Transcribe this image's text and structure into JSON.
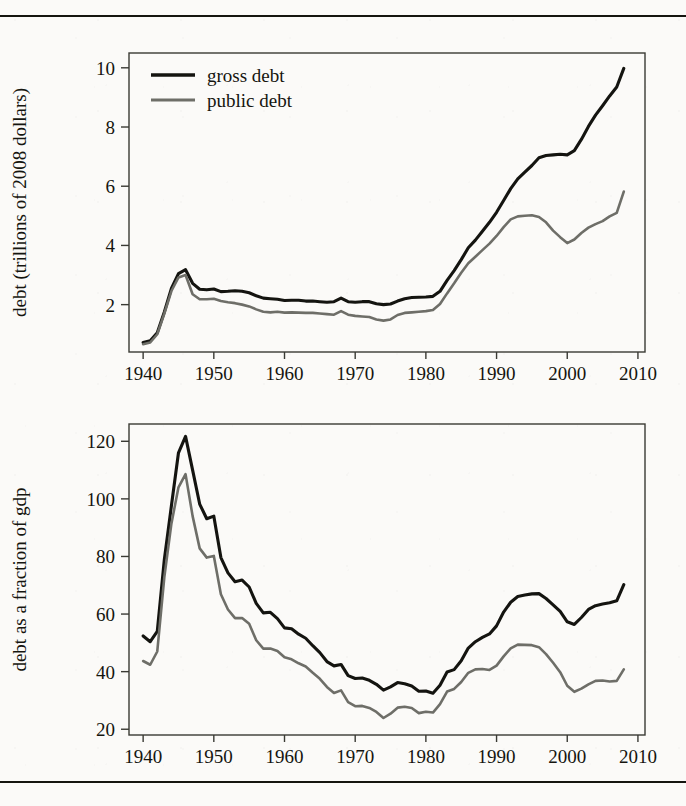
{
  "figure": {
    "kind": "two-panel-line-figure",
    "series_colors": {
      "gross_debt": "#141410",
      "public_debt": "#6e6e68"
    },
    "legend": {
      "position": "top-left-inside-panel-1",
      "entries": [
        {
          "label": "gross debt",
          "color": "#141410"
        },
        {
          "label": "public debt",
          "color": "#6e6e68"
        }
      ]
    }
  },
  "chart_data": [
    {
      "type": "line",
      "panel": "top",
      "title": "",
      "xlabel": "",
      "ylabel": "debt (trillions of 2008 dollars)",
      "xlim": [
        1938,
        2011
      ],
      "ylim": [
        0.4,
        10.5
      ],
      "grid": false,
      "xticks": [
        1940,
        1950,
        1960,
        1970,
        1980,
        1990,
        2000,
        2010
      ],
      "yticks": [
        2,
        4,
        6,
        8,
        10
      ],
      "xticklabels": [
        "1940",
        "1950",
        "1960",
        "1970",
        "1980",
        "1990",
        "2000",
        "2010"
      ],
      "yticklabels": [
        "2",
        "4",
        "6",
        "8",
        "10"
      ],
      "legend_position": "upper left",
      "x": [
        1940,
        1941,
        1942,
        1943,
        1944,
        1945,
        1946,
        1947,
        1948,
        1949,
        1950,
        1951,
        1952,
        1953,
        1954,
        1955,
        1956,
        1957,
        1958,
        1959,
        1960,
        1961,
        1962,
        1963,
        1964,
        1965,
        1966,
        1967,
        1968,
        1969,
        1970,
        1971,
        1972,
        1973,
        1974,
        1975,
        1976,
        1977,
        1978,
        1979,
        1980,
        1981,
        1982,
        1983,
        1984,
        1985,
        1986,
        1987,
        1988,
        1989,
        1990,
        1991,
        1992,
        1993,
        1994,
        1995,
        1996,
        1997,
        1998,
        1999,
        2000,
        2001,
        2002,
        2003,
        2004,
        2005,
        2006,
        2007,
        2008
      ],
      "series": [
        {
          "name": "gross debt",
          "color": "#141410",
          "values": [
            0.72,
            0.78,
            1.05,
            1.75,
            2.55,
            3.05,
            3.18,
            2.72,
            2.52,
            2.5,
            2.53,
            2.44,
            2.45,
            2.47,
            2.45,
            2.4,
            2.3,
            2.22,
            2.2,
            2.18,
            2.14,
            2.15,
            2.15,
            2.12,
            2.12,
            2.1,
            2.08,
            2.1,
            2.22,
            2.1,
            2.08,
            2.1,
            2.1,
            2.03,
            2.0,
            2.02,
            2.12,
            2.2,
            2.24,
            2.25,
            2.26,
            2.28,
            2.45,
            2.82,
            3.15,
            3.52,
            3.92,
            4.18,
            4.48,
            4.78,
            5.12,
            5.52,
            5.92,
            6.25,
            6.48,
            6.7,
            6.96,
            7.04,
            7.06,
            7.08,
            7.06,
            7.2,
            7.58,
            8.02,
            8.4,
            8.72,
            9.05,
            9.35,
            9.98
          ]
        },
        {
          "name": "public debt",
          "color": "#6e6e68",
          "values": [
            0.66,
            0.72,
            1.0,
            1.7,
            2.46,
            2.92,
            3.0,
            2.35,
            2.18,
            2.18,
            2.2,
            2.12,
            2.08,
            2.05,
            2.0,
            1.94,
            1.84,
            1.76,
            1.74,
            1.76,
            1.73,
            1.74,
            1.73,
            1.72,
            1.72,
            1.7,
            1.68,
            1.66,
            1.78,
            1.66,
            1.62,
            1.6,
            1.58,
            1.5,
            1.46,
            1.5,
            1.65,
            1.72,
            1.74,
            1.76,
            1.78,
            1.82,
            2.02,
            2.38,
            2.72,
            3.08,
            3.4,
            3.62,
            3.84,
            4.06,
            4.32,
            4.62,
            4.88,
            4.98,
            5.0,
            5.02,
            4.96,
            4.78,
            4.5,
            4.28,
            4.08,
            4.2,
            4.42,
            4.6,
            4.72,
            4.82,
            4.98,
            5.1,
            5.82
          ]
        }
      ]
    },
    {
      "type": "line",
      "panel": "bottom",
      "title": "",
      "xlabel": "",
      "ylabel": "debt as a fraction of gdp",
      "xlim": [
        1938,
        2011
      ],
      "ylim": [
        18,
        126
      ],
      "grid": false,
      "xticks": [
        1940,
        1950,
        1960,
        1970,
        1980,
        1990,
        2000,
        2010
      ],
      "yticks": [
        20,
        40,
        60,
        80,
        100,
        120
      ],
      "xticklabels": [
        "1940",
        "1950",
        "1960",
        "1970",
        "1980",
        "1990",
        "2000",
        "2010"
      ],
      "yticklabels": [
        "20",
        "40",
        "60",
        "80",
        "100",
        "120"
      ],
      "legend_position": "none",
      "x": [
        1940,
        1941,
        1942,
        1943,
        1944,
        1945,
        1946,
        1947,
        1948,
        1949,
        1950,
        1951,
        1952,
        1953,
        1954,
        1955,
        1956,
        1957,
        1958,
        1959,
        1960,
        1961,
        1962,
        1963,
        1964,
        1965,
        1966,
        1967,
        1968,
        1969,
        1970,
        1971,
        1972,
        1973,
        1974,
        1975,
        1976,
        1977,
        1978,
        1979,
        1980,
        1981,
        1982,
        1983,
        1984,
        1985,
        1986,
        1987,
        1988,
        1989,
        1990,
        1991,
        1992,
        1993,
        1994,
        1995,
        1996,
        1997,
        1998,
        1999,
        2000,
        2001,
        2002,
        2003,
        2004,
        2005,
        2006,
        2007,
        2008
      ],
      "series": [
        {
          "name": "gross debt",
          "color": "#141410",
          "values": [
            52.4,
            50.4,
            54.0,
            79.0,
            97.6,
            116.0,
            121.7,
            110.0,
            98.2,
            93.1,
            94.0,
            79.6,
            74.3,
            71.2,
            71.8,
            69.4,
            63.7,
            60.4,
            60.6,
            58.4,
            55.2,
            54.9,
            53.0,
            51.6,
            49.0,
            46.6,
            43.5,
            42.0,
            42.5,
            38.6,
            37.6,
            37.8,
            37.0,
            35.6,
            33.6,
            34.7,
            36.2,
            35.8,
            35.0,
            33.2,
            33.3,
            32.5,
            35.3,
            39.9,
            40.7,
            43.8,
            48.2,
            50.4,
            51.9,
            53.1,
            55.9,
            60.7,
            64.1,
            66.1,
            66.6,
            67.0,
            67.1,
            65.4,
            63.2,
            60.9,
            57.3,
            56.4,
            58.8,
            61.6,
            62.9,
            63.5,
            63.9,
            64.6,
            70.2
          ]
        },
        {
          "name": "public debt",
          "color": "#6e6e68",
          "values": [
            43.7,
            42.4,
            47.0,
            72.8,
            91.4,
            104.0,
            108.6,
            94.0,
            82.8,
            79.6,
            80.2,
            66.9,
            61.6,
            58.6,
            58.6,
            56.6,
            50.9,
            48.0,
            48.0,
            47.2,
            45.0,
            44.3,
            42.9,
            41.8,
            39.6,
            37.5,
            34.7,
            32.6,
            33.5,
            29.4,
            28.0,
            28.1,
            27.4,
            26.0,
            23.9,
            25.4,
            27.5,
            27.8,
            27.4,
            25.6,
            26.1,
            25.8,
            28.7,
            33.1,
            34.0,
            36.4,
            39.6,
            40.8,
            40.9,
            40.6,
            42.1,
            45.3,
            48.1,
            49.4,
            49.3,
            49.2,
            48.5,
            46.1,
            43.1,
            39.8,
            35.1,
            33.0,
            34.1,
            35.6,
            36.8,
            36.9,
            36.6,
            36.8,
            40.8
          ]
        }
      ]
    }
  ]
}
